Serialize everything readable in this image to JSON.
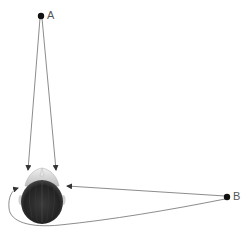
{
  "diagram": {
    "title": "",
    "points": [
      {
        "id": "A",
        "label": "A",
        "x": 41,
        "y": 16
      },
      {
        "id": "B",
        "label": "B",
        "x": 227,
        "y": 197
      }
    ],
    "head": {
      "description": "top-down view of a human head, nose pointing up",
      "cx": 42,
      "cy": 201,
      "rx": 21,
      "ry": 23
    },
    "arrows": [
      {
        "from": "A",
        "to": "head-top-left",
        "type": "straight"
      },
      {
        "from": "A",
        "to": "head-top-right",
        "type": "straight"
      },
      {
        "from": "B",
        "to": "head-right",
        "type": "straight"
      },
      {
        "from": "B",
        "to": "head-left",
        "type": "curved-around-below"
      }
    ],
    "colors": {
      "line": "#6f6f6f",
      "point": "#111111",
      "hair": "#2a2a2a",
      "face": "#d8d8d8",
      "label": "#555555"
    }
  }
}
